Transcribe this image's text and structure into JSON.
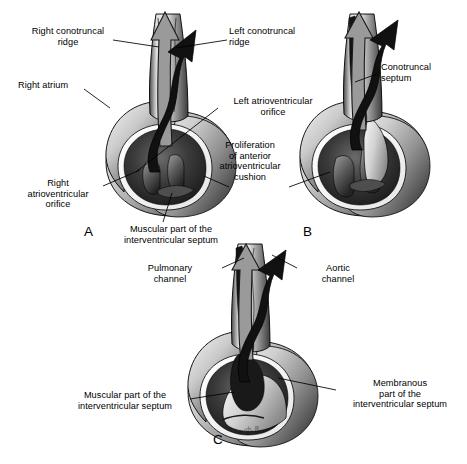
{
  "figure": {
    "background": "#ffffff",
    "ink": "#000000"
  },
  "panels": [
    {
      "id": "A",
      "letter": "A",
      "labels": [
        {
          "key": "right_conotruncal_ridge",
          "text": "Right conotruncal\nridge"
        },
        {
          "key": "left_conotruncal_ridge",
          "text": "Left conotruncal\nridge"
        },
        {
          "key": "right_atrium",
          "text": "Right atrium"
        },
        {
          "key": "left_av_orifice",
          "text": "Left atrioventricular\norifice"
        },
        {
          "key": "right_av_orifice",
          "text": "Right\natrioventricular\norifice"
        },
        {
          "key": "muscular_ivs",
          "text": "Muscular part of the\ninterventricular septum"
        }
      ]
    },
    {
      "id": "B",
      "letter": "B",
      "labels": [
        {
          "key": "conotruncal_septum",
          "text": "Conotruncal\nseptum"
        },
        {
          "key": "proliferation_cushion",
          "text": "Proliferation\nof anterior\natrioventricular\ncushion"
        }
      ]
    },
    {
      "id": "C",
      "letter": "C",
      "labels": [
        {
          "key": "pulmonary_channel",
          "text": "Pulmonary\nchannel"
        },
        {
          "key": "aortic_channel",
          "text": "Aortic\nchannel"
        },
        {
          "key": "muscular_ivs",
          "text": "Muscular part of the\ninterventricular septum"
        },
        {
          "key": "membranous_ivs",
          "text": "Membranous\npart of the\ninterventricular septum"
        }
      ]
    }
  ],
  "artist_signature": "ah. R.",
  "legend": {
    "pulmonary_arrow": "outlined gray arrow — pulmonary channel",
    "aortic_arrow": "solid black arrow — aortic channel"
  },
  "colors": {
    "outline": "#000000",
    "arrow_pulmonary_fill": "#9a9a9a",
    "arrow_pulmonary_stroke": "#1a1a1a",
    "arrow_aortic_fill": "#111111",
    "tissue_light": "#f2f2f2",
    "tissue_mid": "#a8a8a8",
    "tissue_dark": "#2b2b2b",
    "lumen_dark": "#1d1d1d",
    "highlight": "#ffffff"
  }
}
